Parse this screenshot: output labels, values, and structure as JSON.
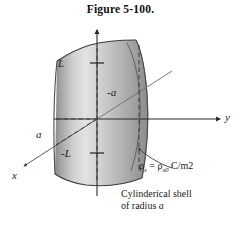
{
  "figure": {
    "title": "Figure 5-100.",
    "caption_line1": "Cylinderical shell",
    "caption_line2_prefix": "of radius ",
    "caption_line2_symbol": "a"
  },
  "axes": {
    "z_label": "",
    "y_label": "y",
    "x_label": "x"
  },
  "labels": {
    "upper_height": "L",
    "lower_height": "-L",
    "radius_left": "a",
    "radius_right": "-a"
  },
  "surface_charge": {
    "symbol": "ρ",
    "symbol_sub": "s",
    "equals": " = ",
    "value_symbol": "ρ",
    "value_sub": "s0",
    "units": " C/m2"
  },
  "colors": {
    "ink": "#1a1a1a",
    "axis": "#2b2b2b",
    "shell_light": "#e3e3e3",
    "shell_mid": "#b8b8b8",
    "shell_dark": "#8f8f8f",
    "shell_edge": "#6e6e6e",
    "background": "#ffffff"
  }
}
